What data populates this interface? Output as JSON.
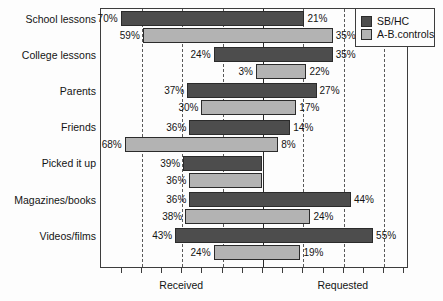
{
  "chart_data": {
    "type": "bar",
    "title": "",
    "subtitle": "",
    "xlabel": "",
    "ylabel": "",
    "orientation": "horizontal-diverging",
    "grid": true,
    "axis_left_label": "Received",
    "axis_right_label": "Requested",
    "xlim": [
      -80,
      80
    ],
    "categories": [
      "School lessons",
      "College lessons",
      "Parents",
      "Friends",
      "Picked it up",
      "Magazines/books",
      "Videos/films"
    ],
    "series": [
      {
        "name": "SB/HC",
        "color": "#4d4d4d",
        "received": [
          70,
          24,
          37,
          36,
          39,
          36,
          43
        ],
        "requested": [
          21,
          35,
          27,
          14,
          0,
          44,
          55
        ],
        "received_labels": [
          "70%",
          "24%",
          "37%",
          "36%",
          "39%",
          "36%",
          "43%"
        ],
        "requested_labels": [
          "21%",
          "35%",
          "27%",
          "14%",
          "",
          "44%",
          "55%"
        ]
      },
      {
        "name": "A-B.controls",
        "color": "#b3b3b3",
        "received": [
          59,
          3,
          30,
          68,
          36,
          38,
          24
        ],
        "requested": [
          35,
          22,
          17,
          8,
          0,
          24,
          19
        ],
        "received_labels": [
          "59%",
          "3%",
          "30%",
          "68%",
          "36%",
          "38%",
          "24%"
        ],
        "requested_labels": [
          "35%",
          "22%",
          "17%",
          "8%",
          "",
          "24%",
          "19%"
        ]
      }
    ],
    "legend": {
      "position": "top-right",
      "entries": [
        "SB/HC",
        "A-B.controls"
      ]
    },
    "gridline_values": [
      -60,
      -40,
      -20,
      20,
      40,
      60
    ],
    "tick_values": [
      -70,
      -60,
      -50,
      -40,
      -30,
      -20,
      -10,
      0,
      10,
      20,
      30,
      40,
      50,
      60,
      70
    ]
  }
}
